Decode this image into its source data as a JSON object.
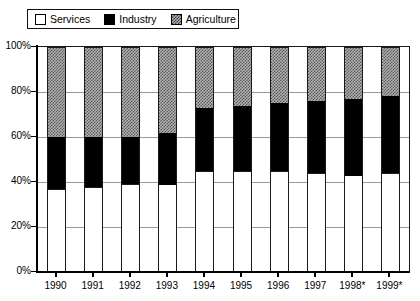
{
  "legend": {
    "position": "top-left",
    "entries": [
      {
        "label": "Services",
        "icon": "white-square-swatch",
        "color": "#ffffff"
      },
      {
        "label": "Industry",
        "icon": "black-square-swatch",
        "color": "#000000"
      },
      {
        "label": "Agriculture",
        "icon": "hatched-square-swatch",
        "color": "#b2b2b2"
      }
    ]
  },
  "axes": {
    "y_ticks": [
      "0%",
      "20%",
      "40%",
      "60%",
      "80%",
      "100%"
    ],
    "x_ticks": [
      "1990",
      "1991",
      "1992",
      "1993",
      "1994",
      "1995",
      "1996",
      "1997",
      "1998*",
      "1999*"
    ]
  },
  "chart_data": {
    "type": "bar",
    "stacked": true,
    "stack_total": 100,
    "title": "",
    "subtitle": "",
    "xlabel": "",
    "ylabel": "",
    "ylim": [
      0,
      100
    ],
    "ytick_step": 20,
    "grid": true,
    "legend_position": "top-left",
    "unit": "%",
    "categories": [
      "1990",
      "1991",
      "1992",
      "1993",
      "1994",
      "1995",
      "1996",
      "1997",
      "1998*",
      "1999*"
    ],
    "series": [
      {
        "name": "Services",
        "values": [
          37,
          38,
          39,
          39,
          45,
          45,
          45,
          44,
          43,
          44
        ]
      },
      {
        "name": "Industry",
        "values": [
          23,
          22,
          21,
          23,
          28,
          29,
          30,
          32,
          34,
          34
        ]
      },
      {
        "name": "Agriculture",
        "values": [
          40,
          40,
          40,
          38,
          27,
          26,
          25,
          24,
          23,
          22
        ]
      }
    ],
    "cumulative_tops": {
      "Services": [
        37,
        38,
        39,
        39,
        45,
        45,
        45,
        44,
        43,
        44
      ],
      "Industry": [
        60,
        60,
        60,
        62,
        73,
        74,
        75,
        76,
        77,
        78
      ],
      "Agriculture": [
        100,
        100,
        100,
        100,
        100,
        100,
        100,
        100,
        100,
        100
      ]
    },
    "notes": [
      "* estimate"
    ]
  }
}
